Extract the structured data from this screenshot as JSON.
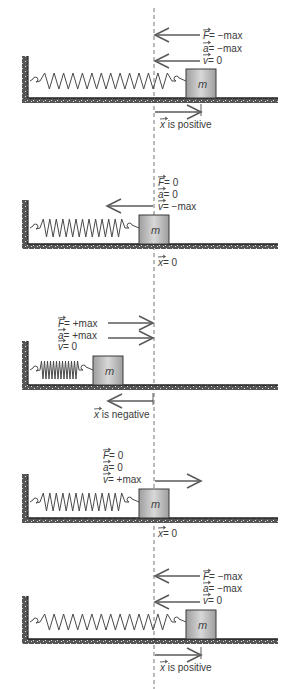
{
  "equilibrium_line": {
    "x": 154,
    "y1": 8,
    "y2": 689,
    "color": "#777777"
  },
  "colors": {
    "stroke": "#5a5a5a",
    "spring": "#4a4a4a",
    "mass_edge": "#9e9e9e",
    "mass_mid": "#d8d8d8",
    "mass_outline": "#3a3a3a",
    "ground": "#555555",
    "speckle": "#dddddd",
    "text": "#3a3a3a"
  },
  "mass_label": "m",
  "panels": [
    {
      "id": "panel-1",
      "state": "maximum extension (right)",
      "wall": {
        "x": 22,
        "top": 56,
        "floor_y": 98
      },
      "floor_right": 278,
      "mass": {
        "x": 186,
        "y": 69,
        "w": 30,
        "h": 29
      },
      "spring": {
        "x1": 30,
        "x2": 182,
        "y": 81,
        "coils": 14,
        "amp": 8
      },
      "arrows": [
        {
          "name": "force-arrow",
          "from": 200,
          "to": 155,
          "y": 35
        },
        {
          "name": "velocity-arrow",
          "from": 200,
          "to": 155,
          "y": 61
        },
        {
          "name": "displacement-arrow",
          "from": 155,
          "to": 201,
          "y": 112,
          "tick": true
        }
      ],
      "labels": [
        {
          "name": "force-label",
          "sym": "F",
          "text": "= −max",
          "x": 203,
          "y": 39
        },
        {
          "name": "acceleration-label",
          "sym": "a",
          "text": "= −max",
          "x": 203,
          "y": 52
        },
        {
          "name": "velocity-label",
          "sym": "v",
          "text": "= 0",
          "x": 203,
          "y": 64
        },
        {
          "name": "displacement-label",
          "sym": "x",
          "text": " is positive",
          "x": 160,
          "y": 128
        }
      ]
    },
    {
      "id": "panel-2",
      "state": "equilibrium moving left",
      "wall": {
        "x": 22,
        "top": 200,
        "floor_y": 244
      },
      "floor_right": 278,
      "mass": {
        "x": 139,
        "y": 215,
        "w": 30,
        "h": 29
      },
      "spring": {
        "x1": 30,
        "x2": 135,
        "y": 228,
        "coils": 13,
        "amp": 9
      },
      "arrows": [
        {
          "name": "velocity-arrow",
          "from": 153,
          "to": 107,
          "y": 206
        }
      ],
      "labels": [
        {
          "name": "force-label",
          "sym": "F",
          "text": "= 0",
          "x": 158,
          "y": 186
        },
        {
          "name": "acceleration-label",
          "sym": "a",
          "text": "= 0",
          "x": 158,
          "y": 198
        },
        {
          "name": "velocity-label",
          "sym": "v",
          "text": "= −max",
          "x": 158,
          "y": 210
        },
        {
          "name": "displacement-label",
          "sym": "x",
          "text": "= 0",
          "x": 158,
          "y": 266
        }
      ]
    },
    {
      "id": "panel-3",
      "state": "maximum compression (left)",
      "wall": {
        "x": 22,
        "top": 341,
        "floor_y": 385
      },
      "floor_right": 278,
      "mass": {
        "x": 93,
        "y": 356,
        "w": 30,
        "h": 29
      },
      "spring": {
        "x1": 30,
        "x2": 89,
        "y": 370,
        "coils": 13,
        "amp": 9
      },
      "arrows": [
        {
          "name": "force-arrow",
          "from": 108,
          "to": 153,
          "y": 323
        },
        {
          "name": "acceleration-arrow",
          "from": 108,
          "to": 153,
          "y": 338
        },
        {
          "name": "displacement-arrow",
          "from": 153,
          "to": 108,
          "y": 401,
          "tick": true
        }
      ],
      "labels": [
        {
          "name": "force-label",
          "sym": "F",
          "text": "= +max",
          "x": 58,
          "y": 327
        },
        {
          "name": "acceleration-label",
          "sym": "a",
          "text": "= +max",
          "x": 58,
          "y": 339
        },
        {
          "name": "velocity-label",
          "sym": "v",
          "text": "= 0",
          "x": 58,
          "y": 350
        },
        {
          "name": "displacement-label",
          "sym": "x",
          "text": " is negative",
          "x": 94,
          "y": 418
        }
      ]
    },
    {
      "id": "panel-4",
      "state": "equilibrium moving right",
      "wall": {
        "x": 22,
        "top": 474,
        "floor_y": 518
      },
      "floor_right": 278,
      "mass": {
        "x": 139,
        "y": 489,
        "w": 30,
        "h": 29
      },
      "spring": {
        "x1": 30,
        "x2": 135,
        "y": 502,
        "coils": 13,
        "amp": 9
      },
      "arrows": [
        {
          "name": "velocity-arrow",
          "from": 155,
          "to": 201,
          "y": 481
        }
      ],
      "labels": [
        {
          "name": "force-label",
          "sym": "F",
          "text": "= 0",
          "x": 103,
          "y": 459
        },
        {
          "name": "acceleration-label",
          "sym": "a",
          "text": "= 0",
          "x": 103,
          "y": 471
        },
        {
          "name": "velocity-label",
          "sym": "v",
          "text": "= +max",
          "x": 103,
          "y": 483
        },
        {
          "name": "displacement-label",
          "sym": "x",
          "text": "= 0",
          "x": 158,
          "y": 537
        }
      ]
    },
    {
      "id": "panel-5",
      "state": "maximum extension (right) again",
      "wall": {
        "x": 22,
        "top": 596,
        "floor_y": 639
      },
      "floor_right": 278,
      "mass": {
        "x": 186,
        "y": 610,
        "w": 30,
        "h": 29
      },
      "spring": {
        "x1": 30,
        "x2": 182,
        "y": 622,
        "coils": 14,
        "amp": 8
      },
      "arrows": [
        {
          "name": "force-arrow",
          "from": 200,
          "to": 155,
          "y": 576
        },
        {
          "name": "velocity-arrow",
          "from": 200,
          "to": 155,
          "y": 602
        },
        {
          "name": "displacement-arrow",
          "from": 155,
          "to": 201,
          "y": 655,
          "tick": true
        }
      ],
      "labels": [
        {
          "name": "force-label",
          "sym": "F",
          "text": "= −max",
          "x": 203,
          "y": 580
        },
        {
          "name": "acceleration-label",
          "sym": "a",
          "text": "= −max",
          "x": 203,
          "y": 592
        },
        {
          "name": "velocity-label",
          "sym": "v",
          "text": "= 0",
          "x": 203,
          "y": 604
        },
        {
          "name": "displacement-label",
          "sym": "x",
          "text": " is positive",
          "x": 160,
          "y": 671
        }
      ]
    }
  ]
}
